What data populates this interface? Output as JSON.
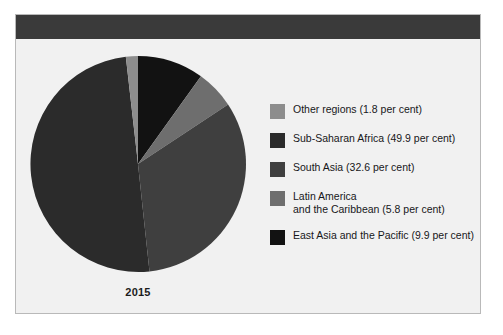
{
  "figure": {
    "year_label": "2015",
    "background_color": "#f1f1f1",
    "header_bar_color": "#3a3a3a",
    "border_color": "#b9b9b9"
  },
  "chart_data": {
    "type": "pie",
    "title": "",
    "subtitle": "",
    "xlabel": "",
    "ylabel": "",
    "year": "2015",
    "units": "per cent",
    "start_angle_deg": 0,
    "direction": "clockwise",
    "legend_position": "right",
    "grid": false,
    "categories": [
      "Other regions",
      "Sub-Saharan Africa",
      "South Asia",
      "Latin America and the Caribbean",
      "East Asia and the Pacific"
    ],
    "values": [
      1.8,
      49.9,
      32.6,
      5.8,
      9.9
    ],
    "colors": [
      "#8d8d8d",
      "#2b2b2b",
      "#3f3f3f",
      "#6e6e6e",
      "#121212"
    ],
    "slice_order_from_top_clockwise": [
      "East Asia and the Pacific",
      "Latin America and the Caribbean",
      "South Asia",
      "Sub-Saharan Africa",
      "Other regions"
    ],
    "slices": [
      {
        "name": "East Asia and the Pacific",
        "value": 9.9,
        "color": "#121212"
      },
      {
        "name": "Latin America and the Caribbean",
        "value": 5.8,
        "color": "#6e6e6e"
      },
      {
        "name": "South Asia",
        "value": 32.6,
        "color": "#3f3f3f"
      },
      {
        "name": "Sub-Saharan Africa",
        "value": 49.9,
        "color": "#2b2b2b"
      },
      {
        "name": "Other regions",
        "value": 1.8,
        "color": "#8d8d8d"
      }
    ]
  },
  "legend": {
    "items": [
      {
        "label": "Other regions (1.8 per cent)",
        "color": "#8d8d8d"
      },
      {
        "label": "Sub-Saharan Africa (49.9 per cent)",
        "color": "#2b2b2b"
      },
      {
        "label": "South Asia (32.6 per cent)",
        "color": "#3f3f3f"
      },
      {
        "label": "Latin America\nand the Caribbean (5.8 per cent)",
        "color": "#6e6e6e"
      },
      {
        "label": "East Asia and the Pacific (9.9 per cent)",
        "color": "#121212"
      }
    ]
  }
}
